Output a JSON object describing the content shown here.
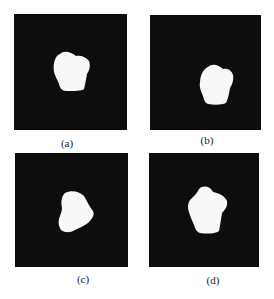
{
  "figure": {
    "panels": [
      {
        "id": "a",
        "caption": "(a)"
      },
      {
        "id": "b",
        "caption": "(b)"
      },
      {
        "id": "c",
        "caption": "(c)"
      },
      {
        "id": "d",
        "caption": "(d)"
      }
    ],
    "colors": {
      "background": "#0d0d0d",
      "shape": "#f8f8f8",
      "page": "#ffffff"
    }
  }
}
